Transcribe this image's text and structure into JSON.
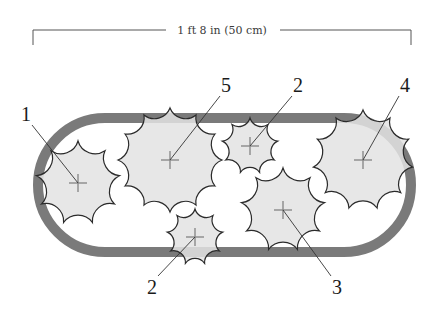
{
  "diagram": {
    "dimension_label": "1 ft 8 in (50 cm)",
    "colors": {
      "bed_outline": "#7a7a7a",
      "bed_outline_light": "#a9a9a9",
      "plant_fill": "#e3e3e3",
      "plant_stroke": "#2a2a2a",
      "center_mark": "#8a8a8a",
      "leader": "#333333"
    },
    "bed": {
      "shape": "stadium",
      "x": 38,
      "y": 118,
      "width": 373,
      "height": 134,
      "stroke_width": 10
    },
    "plants": [
      {
        "label": "1",
        "cx": 78,
        "cy": 183,
        "r": 42,
        "label_x": 26,
        "label_y": 121
      },
      {
        "label": "5",
        "cx": 170,
        "cy": 160,
        "r": 52,
        "label_x": 226,
        "label_y": 92
      },
      {
        "label": "2",
        "cx": 250,
        "cy": 146,
        "r": 28,
        "label_x": 298,
        "label_y": 92
      },
      {
        "label": "4",
        "cx": 363,
        "cy": 160,
        "r": 50,
        "label_x": 405,
        "label_y": 92
      },
      {
        "label": "3",
        "cx": 283,
        "cy": 210,
        "r": 42,
        "label_x": 337,
        "label_y": 294
      },
      {
        "label": "2",
        "cx": 195,
        "cy": 237,
        "r": 28,
        "label_x": 152,
        "label_y": 294
      }
    ]
  }
}
